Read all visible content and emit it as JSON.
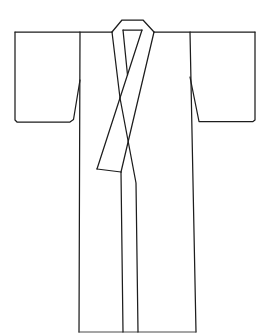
{
  "meta": {
    "background_color": "#ffffff",
    "line_color": "#1d1d1d",
    "hem_line_color": "#4a4a4a"
  },
  "drawing": {
    "subject": "kimono",
    "style": "black outline illustration on white",
    "canvas": {
      "width": 263,
      "height": 334
    },
    "strokes": [
      {
        "name": "shoulder-line-left",
        "thin": false,
        "points": [
          [
            15,
            32
          ],
          [
            112,
            32
          ]
        ]
      },
      {
        "name": "shoulder-line-right",
        "thin": false,
        "points": [
          [
            154,
            32
          ],
          [
            255,
            32
          ]
        ]
      },
      {
        "name": "left-sleeve-outline",
        "thin": false,
        "points": [
          [
            15,
            32
          ],
          [
            15,
            120
          ],
          [
            17,
            122
          ],
          [
            70,
            122
          ],
          [
            73.5,
            119.5
          ],
          [
            80,
            80
          ]
        ]
      },
      {
        "name": "right-sleeve-outline",
        "thin": false,
        "points": [
          [
            255,
            32
          ],
          [
            255,
            120
          ],
          [
            253,
            121.5
          ],
          [
            199,
            121.5
          ],
          [
            190,
            77
          ]
        ]
      },
      {
        "name": "body-side-seam-left",
        "thin": false,
        "points": [
          [
            80,
            32
          ],
          [
            79,
            332
          ]
        ]
      },
      {
        "name": "body-side-seam-right",
        "thin": false,
        "points": [
          [
            190,
            32
          ],
          [
            196,
            332
          ]
        ]
      },
      {
        "name": "hem-line",
        "thin": true,
        "points": [
          [
            79,
            332
          ],
          [
            196,
            332
          ]
        ]
      },
      {
        "name": "back-collar-outer-edge",
        "thin": false,
        "points": [
          [
            112,
            32
          ],
          [
            122,
            20
          ],
          [
            143,
            20
          ],
          [
            154,
            32
          ]
        ]
      },
      {
        "name": "back-collar-inner-seam",
        "thin": false,
        "points": [
          [
            123,
            30
          ],
          [
            142,
            30
          ]
        ]
      },
      {
        "name": "left-collar-band-outer-edge",
        "thin": false,
        "points": [
          [
            112,
            32
          ],
          [
            120,
            98
          ]
        ]
      },
      {
        "name": "left-collar-band-inner-edge",
        "thin": false,
        "points": [
          [
            123,
            30
          ],
          [
            127.5,
            75
          ]
        ]
      },
      {
        "name": "right-collar-band-inner-edge",
        "thin": false,
        "points": [
          [
            142,
            30
          ],
          [
            97,
            169
          ]
        ]
      },
      {
        "name": "right-collar-band-outer-edge",
        "thin": false,
        "points": [
          [
            154,
            32
          ],
          [
            121,
            172
          ]
        ]
      },
      {
        "name": "collar-band-end-edge",
        "thin": false,
        "points": [
          [
            97,
            169
          ],
          [
            121,
            172
          ]
        ]
      },
      {
        "name": "front-opening-under-panel-edge",
        "thin": false,
        "points": [
          [
            120,
            98
          ],
          [
            136,
            183
          ],
          [
            138,
            332
          ]
        ]
      },
      {
        "name": "front-opening-over-panel-edge",
        "thin": false,
        "points": [
          [
            121,
            172
          ],
          [
            123,
            332
          ]
        ]
      }
    ]
  }
}
